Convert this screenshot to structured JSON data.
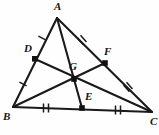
{
  "figure": {
    "name": "triangle-centroid-medians",
    "width": 159,
    "height": 135,
    "background_color": "#fefefe",
    "stroke_color": "#1a1a1a",
    "point_fill_color": "#111111",
    "tick_color": "#1a1a1a"
  },
  "labels": {
    "A": "A",
    "B": "B",
    "C": "C",
    "D": "D",
    "E": "E",
    "F": "F",
    "G": "G"
  },
  "points": [
    {
      "id": "A",
      "label": "A",
      "x": 57,
      "y": 18,
      "role": "vertex",
      "label_x": 54,
      "label_y": 2,
      "dot": false
    },
    {
      "id": "B",
      "label": "B",
      "x": 13,
      "y": 107,
      "role": "vertex",
      "label_x": 3,
      "label_y": 112,
      "dot": false
    },
    {
      "id": "C",
      "label": "C",
      "x": 152,
      "y": 112,
      "role": "vertex",
      "label_x": 150,
      "label_y": 117,
      "dot": false
    },
    {
      "id": "D",
      "label": "D",
      "x": 35,
      "y": 59,
      "role": "midpoint",
      "label_x": 24,
      "label_y": 44,
      "dot": true
    },
    {
      "id": "E",
      "label": "E",
      "x": 82,
      "y": 108,
      "role": "midpoint",
      "label_x": 84,
      "label_y": 92,
      "dot": true
    },
    {
      "id": "F",
      "label": "F",
      "x": 105,
      "y": 63,
      "role": "midpoint",
      "label_x": 104,
      "label_y": 47,
      "dot": true
    },
    {
      "id": "G",
      "label": "G",
      "x": 74,
      "y": 79,
      "role": "centroid",
      "label_x": 69,
      "label_y": 62,
      "dot": true
    }
  ],
  "segments": [
    {
      "id": "side-AB",
      "from": "A",
      "to": "B",
      "name": "triangle-side-ab"
    },
    {
      "id": "side-AC",
      "from": "A",
      "to": "C",
      "name": "triangle-side-ac"
    },
    {
      "id": "side-BC",
      "from": "B",
      "to": "C",
      "name": "triangle-side-bc"
    },
    {
      "id": "median-AE",
      "from": "A",
      "to": "E",
      "name": "median-a-to-e"
    },
    {
      "id": "median-BF",
      "from": "B",
      "to": "F",
      "name": "median-b-to-f"
    },
    {
      "id": "median-CD",
      "from": "C",
      "to": "D",
      "name": "median-c-to-d"
    }
  ],
  "tick_marks": [
    {
      "id": "tick-AD",
      "on_segment": "A-D",
      "count": 1,
      "x": 42,
      "y": 38,
      "angle": -63,
      "name": "tick-mark-ad-single"
    },
    {
      "id": "tick-DB",
      "on_segment": "D-B",
      "count": 1,
      "x": 23,
      "y": 84,
      "angle": -63,
      "name": "tick-mark-db-single"
    },
    {
      "id": "tick-AF",
      "on_segment": "A-F",
      "count": 2,
      "x": 82,
      "y": 40,
      "angle": -41,
      "name": "tick-mark-af-double"
    },
    {
      "id": "tick-FC",
      "on_segment": "F-C",
      "count": 2,
      "x": 128,
      "y": 87,
      "angle": -41,
      "name": "tick-mark-fc-double"
    },
    {
      "id": "tick-BE",
      "on_segment": "B-E",
      "count": 2,
      "x": 46,
      "y": 108,
      "angle": 0,
      "name": "tick-mark-be-double"
    },
    {
      "id": "tick-EC",
      "on_segment": "E-C",
      "count": 2,
      "x": 118,
      "y": 110,
      "angle": 0,
      "name": "tick-mark-ec-double"
    }
  ]
}
